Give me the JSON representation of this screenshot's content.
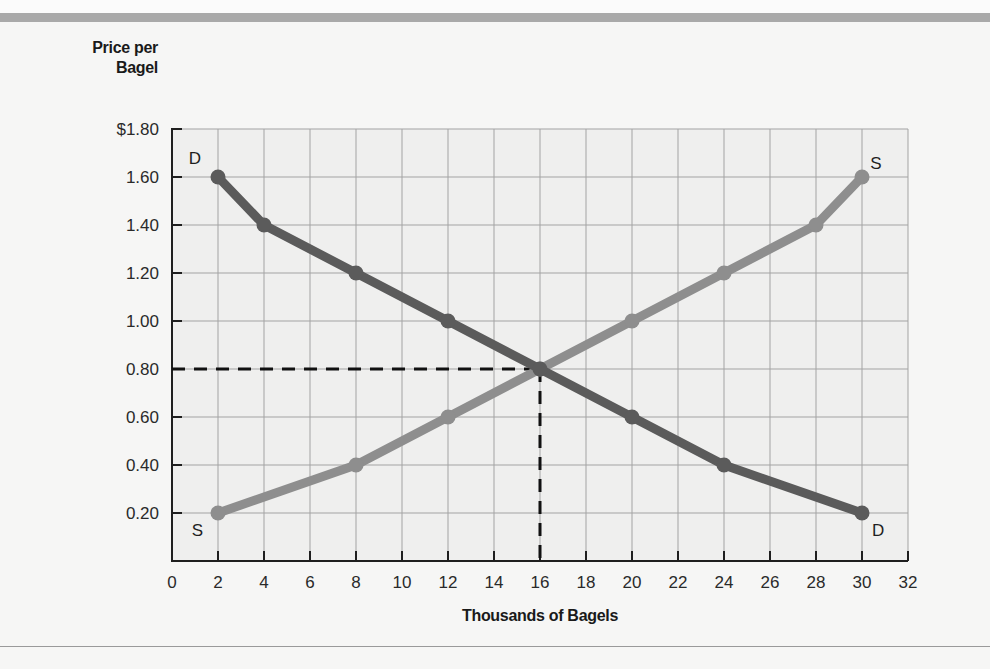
{
  "chart_data": {
    "type": "line",
    "title": "",
    "xlabel": "Thousands of Bagels",
    "ylabel": "Price per Bagel",
    "ylabel_lines": [
      "Price per",
      "Bagel"
    ],
    "xlim": [
      0,
      32
    ],
    "ylim": [
      0,
      1.8
    ],
    "grid": true,
    "x_ticks": [
      0,
      2,
      4,
      6,
      8,
      10,
      12,
      14,
      16,
      18,
      20,
      22,
      24,
      26,
      28,
      30,
      32
    ],
    "x_tick_labels": [
      "0",
      "2",
      "4",
      "6",
      "8",
      "10",
      "12",
      "14",
      "16",
      "18",
      "20",
      "22",
      "24",
      "26",
      "28",
      "30",
      "32"
    ],
    "y_ticks": [
      0.2,
      0.4,
      0.6,
      0.8,
      1.0,
      1.2,
      1.4,
      1.6,
      1.8
    ],
    "y_tick_labels": [
      "0.20",
      "0.40",
      "0.60",
      "0.80",
      "1.00",
      "1.20",
      "1.40",
      "1.60",
      "$1.80"
    ],
    "series": [
      {
        "name": "Demand",
        "label": "D",
        "color": "#5b5b5b",
        "x": [
          2,
          4,
          8,
          12,
          16,
          20,
          24,
          30
        ],
        "y": [
          1.6,
          1.4,
          1.2,
          1.0,
          0.8,
          0.6,
          0.4,
          0.2
        ]
      },
      {
        "name": "Supply",
        "label": "S",
        "color": "#8e8e8e",
        "x": [
          2,
          8,
          12,
          16,
          20,
          24,
          28,
          30
        ],
        "y": [
          0.2,
          0.4,
          0.6,
          0.8,
          1.0,
          1.2,
          1.4,
          1.6
        ]
      }
    ],
    "annotations": [
      {
        "text": "D",
        "x": 1.0,
        "y": 1.68,
        "series": "Demand",
        "position": "start"
      },
      {
        "text": "D",
        "x": 30.7,
        "y": 0.13,
        "series": "Demand",
        "position": "end"
      },
      {
        "text": "S",
        "x": 1.1,
        "y": 0.13,
        "series": "Supply",
        "position": "start"
      },
      {
        "text": "S",
        "x": 30.6,
        "y": 1.66,
        "series": "Supply",
        "position": "end"
      }
    ],
    "equilibrium": {
      "quantity": 16,
      "price": 0.8,
      "style": "dashed",
      "color": "#111111"
    }
  }
}
